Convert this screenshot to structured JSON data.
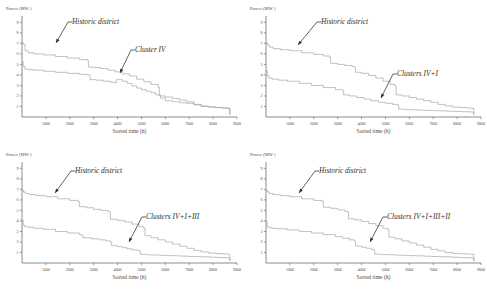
{
  "figure": {
    "panel_count": 4,
    "line_color": "#9a9a9a",
    "axis_color": "#5d5d5d",
    "text_color": "#2e2e2e",
    "background": "#ffffff"
  },
  "axes": {
    "ylabel": "Power (MW )",
    "xlabel": "Sorted time (h)",
    "yticks": [
      "1",
      "2",
      "3",
      "4",
      "5",
      "6",
      "7",
      "8",
      "9"
    ],
    "ytick_values": [
      1,
      2,
      3,
      4,
      5,
      6,
      7,
      8,
      9
    ],
    "xticks": [
      "1000",
      "2000",
      "3000",
      "4000",
      "5000",
      "6000",
      "7000",
      "8000",
      "9000"
    ],
    "xtick_values": [
      1000,
      2000,
      3000,
      4000,
      5000,
      6000,
      7000,
      8000,
      9000
    ],
    "xlim": [
      0,
      9000
    ],
    "ylim": [
      0,
      9.6
    ],
    "grid": false
  },
  "annotations": {
    "historic": "Historic district",
    "cluster_a": "Cluster IV",
    "cluster_b": "Clusters IV+I",
    "cluster_c": "Clusters IV+I+III",
    "cluster_d": "Clusters IV+I+III+II"
  },
  "chart_data": [
    {
      "type": "line",
      "id": "panel-a",
      "title": "",
      "xlabel": "Sorted time (h)",
      "ylabel": "Power (MW )",
      "xlim": [
        0,
        9000
      ],
      "ylim": [
        0,
        9.6
      ],
      "grid": false,
      "legend_position": "inline-annotation",
      "series": [
        {
          "name": "Historic district",
          "x": [
            0,
            60,
            130,
            260,
            500,
            900,
            1400,
            1900,
            2400,
            2750,
            2780,
            3000,
            3300,
            3600,
            3900,
            4200,
            4500,
            4800,
            5100,
            5400,
            5700,
            5750,
            6000,
            6300,
            6600,
            6900,
            7200,
            7500,
            7800,
            8100,
            8400,
            8650,
            8700
          ],
          "y": [
            7.1,
            6.9,
            6.3,
            6.1,
            6.0,
            5.9,
            5.75,
            5.6,
            5.45,
            5.35,
            4.75,
            4.7,
            4.6,
            4.45,
            4.3,
            4.1,
            3.9,
            3.6,
            3.35,
            3.1,
            2.8,
            2.0,
            1.9,
            1.75,
            1.6,
            1.45,
            1.2,
            1.0,
            0.95,
            0.9,
            0.85,
            0.8,
            0.2
          ]
        },
        {
          "name": "Cluster IV",
          "x": [
            0,
            50,
            120,
            250,
            500,
            900,
            1400,
            1900,
            2400,
            2700,
            2850,
            3100,
            3400,
            3700,
            3900,
            3950,
            4200,
            4400,
            4600,
            4800,
            5000,
            5200,
            5400,
            5600,
            5800,
            6000,
            6300,
            6600,
            6900,
            7200,
            7500,
            7800,
            8100,
            8400,
            8650,
            8700
          ],
          "y": [
            5.3,
            4.8,
            4.55,
            4.5,
            4.45,
            4.35,
            4.25,
            4.15,
            4.05,
            4.0,
            3.55,
            3.5,
            3.4,
            3.3,
            3.25,
            3.55,
            3.4,
            3.2,
            2.95,
            2.75,
            2.6,
            2.45,
            2.3,
            2.1,
            1.8,
            1.55,
            1.45,
            1.35,
            1.3,
            1.15,
            1.05,
            0.95,
            0.9,
            0.85,
            0.8,
            0.2
          ]
        }
      ]
    },
    {
      "type": "line",
      "id": "panel-b",
      "title": "",
      "xlabel": "Sorted time (h)",
      "ylabel": "Power (MW )",
      "xlim": [
        0,
        9000
      ],
      "ylim": [
        0,
        9.6
      ],
      "grid": false,
      "legend_position": "inline-annotation",
      "series": [
        {
          "name": "Historic district",
          "x": [
            0,
            60,
            140,
            300,
            600,
            1000,
            1500,
            2000,
            2400,
            2650,
            2700,
            3000,
            3300,
            3600,
            3700,
            3750,
            4000,
            4300,
            4600,
            4900,
            5200,
            5400,
            5450,
            5700,
            6000,
            6300,
            6600,
            6900,
            7200,
            7500,
            7800,
            8100,
            8400,
            8650,
            8700
          ],
          "y": [
            7.05,
            6.85,
            6.65,
            6.5,
            6.4,
            6.3,
            6.1,
            5.95,
            5.8,
            5.7,
            5.1,
            5.0,
            4.9,
            4.8,
            4.75,
            4.25,
            4.15,
            3.95,
            3.7,
            3.4,
            3.1,
            2.9,
            2.1,
            2.0,
            1.85,
            1.7,
            1.55,
            1.4,
            1.2,
            1.05,
            0.95,
            0.9,
            0.85,
            0.8,
            0.2
          ]
        },
        {
          "name": "Clusters IV+I",
          "x": [
            0,
            50,
            120,
            260,
            520,
            900,
            1400,
            1900,
            2400,
            2900,
            3200,
            3250,
            3500,
            3800,
            4100,
            4400,
            4700,
            5000,
            5300,
            5500,
            5550,
            5800,
            6100,
            6400,
            6700,
            7000,
            7300,
            7600,
            7900,
            8200,
            8500,
            8650,
            8700
          ],
          "y": [
            4.4,
            3.95,
            3.7,
            3.6,
            3.5,
            3.4,
            3.2,
            3.0,
            2.8,
            2.6,
            2.5,
            2.1,
            2.0,
            1.85,
            1.7,
            1.55,
            1.4,
            1.3,
            1.2,
            1.15,
            0.75,
            0.7,
            0.68,
            0.65,
            0.62,
            0.6,
            0.58,
            0.55,
            0.52,
            0.5,
            0.48,
            0.45,
            0.2
          ]
        }
      ]
    },
    {
      "type": "line",
      "id": "panel-c",
      "title": "",
      "xlabel": "Sorted time (h)",
      "ylabel": "Power (MW )",
      "xlim": [
        0,
        9000
      ],
      "ylim": [
        0,
        9.6
      ],
      "grid": false,
      "legend_position": "inline-annotation",
      "series": [
        {
          "name": "Historic district",
          "x": [
            0,
            60,
            140,
            300,
            600,
            1000,
            1500,
            2000,
            2350,
            2400,
            2700,
            3000,
            3300,
            3600,
            3650,
            3700,
            4000,
            4300,
            4600,
            4900,
            5100,
            5150,
            5400,
            5700,
            6000,
            6300,
            6600,
            6900,
            7200,
            7500,
            7800,
            8100,
            8400,
            8650,
            8700
          ],
          "y": [
            6.9,
            6.75,
            6.6,
            6.5,
            6.4,
            6.3,
            6.1,
            5.95,
            5.85,
            5.35,
            5.25,
            5.1,
            5.0,
            4.9,
            4.85,
            4.15,
            4.05,
            3.9,
            3.7,
            3.45,
            3.3,
            2.6,
            2.4,
            2.2,
            2.0,
            1.8,
            1.6,
            1.4,
            1.2,
            1.05,
            0.95,
            0.9,
            0.85,
            0.8,
            0.2
          ]
        },
        {
          "name": "Clusters IV+I+III",
          "x": [
            0,
            50,
            110,
            250,
            500,
            900,
            1400,
            1900,
            2400,
            2500,
            2550,
            2900,
            3200,
            3500,
            3700,
            3750,
            4000,
            4200,
            4400,
            4600,
            4800,
            4900,
            4950,
            5200,
            5500,
            5800,
            6100,
            6400,
            6700,
            7000,
            7300,
            7600,
            7900,
            8200,
            8500,
            8650,
            8700
          ],
          "y": [
            4.1,
            3.6,
            3.45,
            3.4,
            3.3,
            3.2,
            3.0,
            2.85,
            2.7,
            2.65,
            2.4,
            2.3,
            2.2,
            2.1,
            2.0,
            1.65,
            1.55,
            1.45,
            1.35,
            1.25,
            1.2,
            1.15,
            0.82,
            0.78,
            0.75,
            0.72,
            0.7,
            0.68,
            0.65,
            0.62,
            0.6,
            0.58,
            0.55,
            0.52,
            0.5,
            0.45,
            0.2
          ]
        }
      ]
    },
    {
      "type": "line",
      "id": "panel-d",
      "title": "",
      "xlabel": "Sorted time (h)",
      "ylabel": "Power (MW )",
      "xlim": [
        0,
        9000
      ],
      "ylim": [
        0,
        9.6
      ],
      "grid": false,
      "legend_position": "inline-annotation",
      "series": [
        {
          "name": "Historic district",
          "x": [
            0,
            60,
            140,
            300,
            600,
            1000,
            1500,
            2000,
            2350,
            2400,
            2700,
            3000,
            3300,
            3400,
            3450,
            3700,
            4000,
            4300,
            4600,
            4900,
            5100,
            5150,
            5400,
            5700,
            6000,
            6300,
            6600,
            6900,
            7200,
            7500,
            7800,
            8100,
            8400,
            8650,
            8700
          ],
          "y": [
            6.9,
            6.75,
            6.6,
            6.5,
            6.4,
            6.3,
            6.1,
            5.95,
            5.85,
            5.3,
            5.2,
            5.05,
            4.9,
            4.85,
            4.2,
            4.1,
            3.95,
            3.75,
            3.55,
            3.3,
            3.15,
            2.45,
            2.3,
            2.1,
            1.9,
            1.7,
            1.5,
            1.3,
            1.15,
            1.0,
            0.92,
            0.88,
            0.85,
            0.8,
            0.2
          ]
        },
        {
          "name": "Clusters IV+I+III+II",
          "x": [
            0,
            50,
            110,
            250,
            500,
            900,
            1400,
            1900,
            2400,
            2900,
            3200,
            3500,
            3700,
            3750,
            4000,
            4200,
            4400,
            4500,
            4550,
            4800,
            5100,
            5400,
            5700,
            6000,
            6300,
            6600,
            6900,
            7200,
            7500,
            7800,
            8100,
            8400,
            8650,
            8700
          ],
          "y": [
            3.95,
            3.45,
            3.35,
            3.3,
            3.25,
            3.15,
            3.0,
            2.85,
            2.7,
            2.5,
            2.35,
            2.2,
            2.1,
            1.6,
            1.5,
            1.4,
            1.3,
            1.25,
            0.85,
            0.8,
            0.78,
            0.75,
            0.72,
            0.7,
            0.68,
            0.65,
            0.62,
            0.6,
            0.58,
            0.55,
            0.52,
            0.5,
            0.45,
            0.2
          ]
        }
      ]
    }
  ]
}
